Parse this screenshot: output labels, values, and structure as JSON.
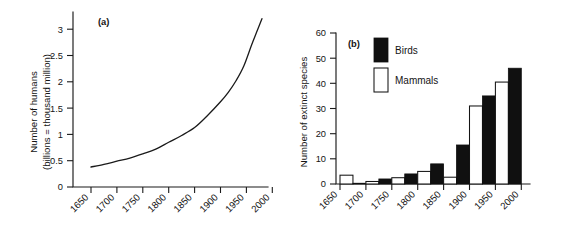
{
  "figure": {
    "panel_a_tag": "(a)",
    "panel_b_tag": "(b)"
  },
  "chart_data": [
    {
      "type": "line",
      "panel": "(a)",
      "title": "",
      "xlabel": "",
      "ylabel": "Number of humans (billions = thousand million)",
      "ylabel_line1": "Number of humans",
      "ylabel_line2": "(billions = thousand million)",
      "xlim": [
        1650,
        2000
      ],
      "ylim": [
        0,
        3.25
      ],
      "grid": false,
      "xticks": [
        1650,
        1700,
        1750,
        1800,
        1850,
        1900,
        1950,
        2000
      ],
      "xticklabels": [
        "1650",
        "1700",
        "1750",
        "1800",
        "1850",
        "1900",
        "1950",
        "2000"
      ],
      "yticks": [
        0,
        0.5,
        1,
        1.5,
        2,
        2.5,
        3
      ],
      "yticklabels": [
        "0",
        "0.5",
        "1",
        "1.5",
        "2",
        "2.5",
        "3"
      ],
      "x": [
        1650,
        1675,
        1700,
        1725,
        1750,
        1775,
        1800,
        1825,
        1850,
        1875,
        1900,
        1915,
        1930,
        1945,
        1960,
        1970,
        1980
      ],
      "values": [
        0.38,
        0.43,
        0.49,
        0.55,
        0.63,
        0.72,
        0.85,
        0.98,
        1.13,
        1.36,
        1.62,
        1.8,
        2.02,
        2.3,
        2.7,
        2.95,
        3.2
      ]
    },
    {
      "type": "bar",
      "panel": "(b)",
      "title": "",
      "xlabel": "",
      "ylabel": "Number of extinct species",
      "ylim": [
        0,
        60
      ],
      "grid": false,
      "xticks": [
        1650,
        1700,
        1750,
        1800,
        1850,
        1900,
        1950,
        2000
      ],
      "xticklabels": [
        "1650",
        "1700",
        "1750",
        "1800",
        "1850",
        "1900",
        "1950",
        "2000"
      ],
      "yticks": [
        0,
        10,
        20,
        30,
        40,
        50,
        60
      ],
      "yticklabels": [
        "0",
        "10",
        "20",
        "30",
        "40",
        "50",
        "60"
      ],
      "categories": [
        "1650-1700",
        "1700-1750",
        "1750-1800",
        "1800-1850",
        "1850-1900",
        "1900-1950",
        "1950-2000"
      ],
      "legend_position": "upper-left",
      "series": [
        {
          "name": "Mammals",
          "color": "#ffffff",
          "values": [
            3.5,
            1.0,
            2.5,
            5.0,
            2.7,
            31.0,
            40.5
          ]
        },
        {
          "name": "Birds",
          "color": "#101010",
          "values": [
            0.3,
            2.0,
            4.0,
            8.0,
            15.5,
            35.0,
            46.0
          ]
        }
      ]
    }
  ],
  "legend": {
    "birds_label": "Birds",
    "mammals_label": "Mammals"
  }
}
